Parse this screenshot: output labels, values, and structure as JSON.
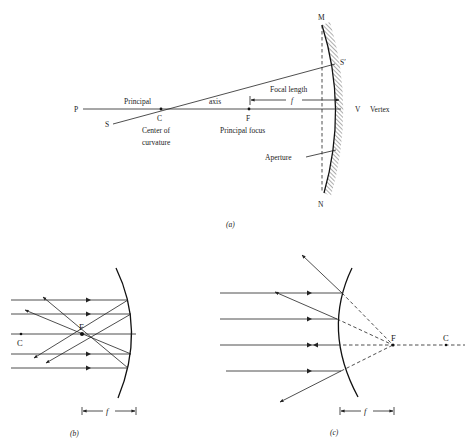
{
  "figure_a": {
    "caption": "(a)",
    "labels": {
      "M": "M",
      "N": "N",
      "S_prime": "S′",
      "V": "V",
      "vertex": "Vertex",
      "P": "P",
      "S": "S",
      "C": "C",
      "F": "F",
      "principal": "Principal",
      "axis": "axis",
      "focal_length": "Focal length",
      "f": "f",
      "center_of": "Center of",
      "curvature": "curvature",
      "principal_focus": "Principal focus",
      "aperture": "Aperture"
    }
  },
  "figure_b": {
    "caption": "(b)",
    "labels": {
      "F": "F",
      "C": "C",
      "f": "f"
    },
    "mirror_type": "concave"
  },
  "figure_c": {
    "caption": "(c)",
    "labels": {
      "F": "F",
      "C": "C",
      "f": "f"
    },
    "mirror_type": "convex"
  }
}
